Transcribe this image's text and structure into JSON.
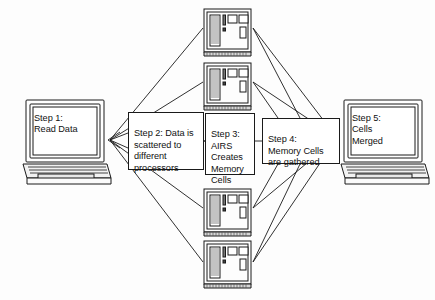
{
  "diagram": {
    "background_color": "#fdfdfd",
    "line_color": "#1a1a1a",
    "width": 435,
    "height": 300
  },
  "nodes": {
    "step1": {
      "id": "step1",
      "kind": "laptop",
      "label": "Step 1:\nRead Data",
      "icon": "laptop-computer-icon"
    },
    "step2": {
      "id": "step2",
      "kind": "textbox",
      "label": "Step 2:  Data is scattered to different processors"
    },
    "step3": {
      "id": "step3",
      "kind": "textbox",
      "label": "Step 3:\nAIRS\nCreates\nMemory\nCells"
    },
    "step4": {
      "id": "step4",
      "kind": "textbox",
      "label": "Step 4:\nMemory Cells\nare gathered"
    },
    "step5": {
      "id": "step5",
      "kind": "laptop",
      "label": "Step 5:\nCells\nMerged",
      "icon": "laptop-computer-icon"
    }
  },
  "processors": [
    {
      "id": "processor-1",
      "icon": "tower-computer-icon",
      "label": ""
    },
    {
      "id": "processor-2",
      "icon": "tower-computer-icon",
      "label": ""
    },
    {
      "id": "processor-3",
      "icon": "tower-computer-icon",
      "label": ""
    },
    {
      "id": "processor-4",
      "icon": "tower-computer-icon",
      "label": ""
    }
  ],
  "edges": {
    "scatter_from": {
      "x": 110,
      "y": 140
    },
    "gather_to": {
      "x": 337,
      "y": 138
    },
    "scatter_targets": [
      {
        "x": 202,
        "y": 26
      },
      {
        "x": 202,
        "y": 80
      },
      {
        "x": 205,
        "y": 140
      },
      {
        "x": 202,
        "y": 206
      },
      {
        "x": 202,
        "y": 258
      }
    ],
    "gather_sources": [
      {
        "x": 254,
        "y": 26
      },
      {
        "x": 254,
        "y": 80
      },
      {
        "x": 255,
        "y": 140
      },
      {
        "x": 254,
        "y": 206
      },
      {
        "x": 254,
        "y": 258
      }
    ]
  }
}
